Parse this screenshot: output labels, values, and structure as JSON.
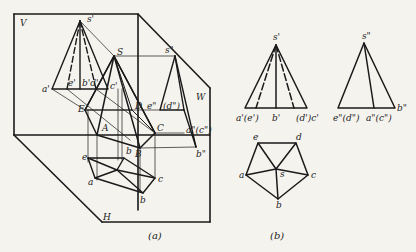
{
  "figure": {
    "part_a": {
      "caption": "(a)",
      "planes": {
        "V": "V",
        "H": "H",
        "W": "W"
      },
      "space_points": {
        "S": "S",
        "A": "A",
        "B": "B",
        "C": "C",
        "D": "D",
        "E": "E"
      },
      "front_projection_labels": {
        "s": "s'",
        "a": "a'",
        "e": "e'",
        "bd": "b'd'",
        "c": "c'"
      },
      "side_projection_labels": {
        "s": "s\"",
        "e": "e\"",
        "d": "(d\")",
        "ac": "a\"(c\")",
        "b": "b\""
      },
      "top_projection_labels": {
        "a": "a",
        "b": "b",
        "c": "c",
        "e": "e",
        "b2": "b"
      }
    },
    "part_b": {
      "caption": "(b)",
      "front_view": {
        "apex": "s'",
        "base_labels": [
          "a'(e')",
          "b'",
          "(d')c'"
        ]
      },
      "side_view": {
        "apex": "s\"",
        "base_labels": [
          "e\"(d\")",
          "a\"(c\")",
          "b\""
        ]
      },
      "top_view": {
        "labels": {
          "a": "a",
          "b": "b",
          "c": "c",
          "d": "d",
          "e": "e",
          "s": "s"
        }
      }
    }
  }
}
